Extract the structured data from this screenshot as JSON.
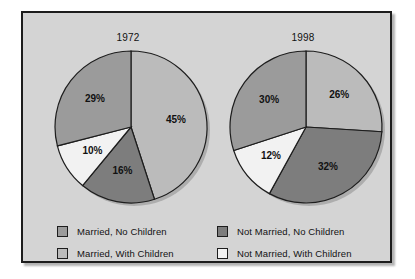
{
  "chart_data": [
    {
      "type": "pie",
      "title": "1972",
      "categories": [
        "Married, With Children",
        "Not Married, No Children",
        "Not Married, With Children",
        "Married, No Children"
      ],
      "values": [
        45,
        16,
        10,
        29
      ],
      "labels": [
        "45%",
        "16%",
        "10%",
        "29%"
      ],
      "colors": [
        "#bbbbbb",
        "#7d7d7d",
        "#f2f2f2",
        "#9b9b9b"
      ],
      "start_angle_deg": 0,
      "direction": "clockwise",
      "legend_position": "bottom"
    },
    {
      "type": "pie",
      "title": "1998",
      "categories": [
        "Married, With Children",
        "Not Married, No Children",
        "Not Married, With Children",
        "Married, No Children"
      ],
      "values": [
        26,
        32,
        12,
        30
      ],
      "labels": [
        "26%",
        "32%",
        "12%",
        "30%"
      ],
      "colors": [
        "#bbbbbb",
        "#7d7d7d",
        "#f2f2f2",
        "#9b9b9b"
      ],
      "start_angle_deg": 0,
      "direction": "clockwise",
      "legend_position": "bottom"
    }
  ],
  "pies": [
    {
      "title": "1972",
      "slices": [
        {
          "label": "45%",
          "value": 45,
          "category": "Married, With Children",
          "color": "#bbbbbb"
        },
        {
          "label": "16%",
          "value": 16,
          "category": "Not Married, No Children",
          "color": "#7d7d7d"
        },
        {
          "label": "10%",
          "value": 10,
          "category": "Not Married, With Children",
          "color": "#f2f2f2"
        },
        {
          "label": "29%",
          "value": 29,
          "category": "Married, No Children",
          "color": "#9b9b9b"
        }
      ]
    },
    {
      "title": "1998",
      "slices": [
        {
          "label": "26%",
          "value": 26,
          "category": "Married, With Children",
          "color": "#bbbbbb"
        },
        {
          "label": "32%",
          "value": 32,
          "category": "Not Married, No Children",
          "color": "#7d7d7d"
        },
        {
          "label": "12%",
          "value": 12,
          "category": "Not Married, With Children",
          "color": "#f2f2f2"
        },
        {
          "label": "30%",
          "value": 30,
          "category": "Married, No Children",
          "color": "#9b9b9b"
        }
      ]
    }
  ],
  "legend": {
    "items": [
      {
        "label": "Married, No Children",
        "color": "#9b9b9b",
        "column": 0,
        "row": 0
      },
      {
        "label": "Married, With Children",
        "color": "#bbbbbb",
        "column": 0,
        "row": 1
      },
      {
        "label": "Not Married, No Children",
        "color": "#7d7d7d",
        "column": 1,
        "row": 0
      },
      {
        "label": "Not Married, With Children",
        "color": "#f2f2f2",
        "column": 1,
        "row": 1
      }
    ]
  },
  "style": {
    "panel_background": "#d4d4d4",
    "panel_border": "#1d1d1d",
    "page_background": "#ffffff",
    "text_color": "#111111"
  }
}
